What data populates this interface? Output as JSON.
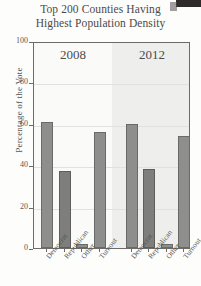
{
  "chart_data": {
    "type": "bar",
    "title": "Top 200 Counties Having Highest Population Density",
    "title_line1": "Top 200 Counties Having",
    "title_line2": "Highest Population Density",
    "xlabel": "",
    "ylabel": "Percentage of the Vote",
    "ylim": [
      0,
      100
    ],
    "yticks": [
      0,
      20,
      40,
      60,
      80,
      100
    ],
    "ytick_labels": [
      "0",
      "20",
      "40",
      "60",
      "80",
      "100"
    ],
    "grid": true,
    "legend": "none",
    "panels": [
      {
        "label": "2008",
        "categories": [
          "Democrat",
          "Republican",
          "Other",
          "Turnout"
        ],
        "values": [
          61,
          37,
          2,
          56
        ]
      },
      {
        "label": "2012",
        "categories": [
          "Democrat",
          "Republican",
          "Other",
          "Turnout"
        ],
        "values": [
          60,
          38,
          2,
          54
        ]
      }
    ],
    "categories": [
      "Democrat",
      "Republican",
      "Other",
      "Turnout"
    ],
    "series": [
      {
        "name": "2008",
        "values": [
          61,
          37,
          2,
          56
        ]
      },
      {
        "name": "2012",
        "values": [
          60,
          38,
          2,
          54
        ]
      }
    ],
    "colors": {
      "bar_fill": "#8e8e8c",
      "bar_fill_dark": "#7e7e7c",
      "bar_edge": "#6a6a68",
      "panel_2008_bg": "#fafaf9",
      "panel_2012_bg": "#eeeeec",
      "axis": "#6d6a68",
      "grid": "#e2e1de",
      "text": "#4c4a48"
    }
  },
  "artifact": {
    "name": "scan-edge-artifact"
  }
}
